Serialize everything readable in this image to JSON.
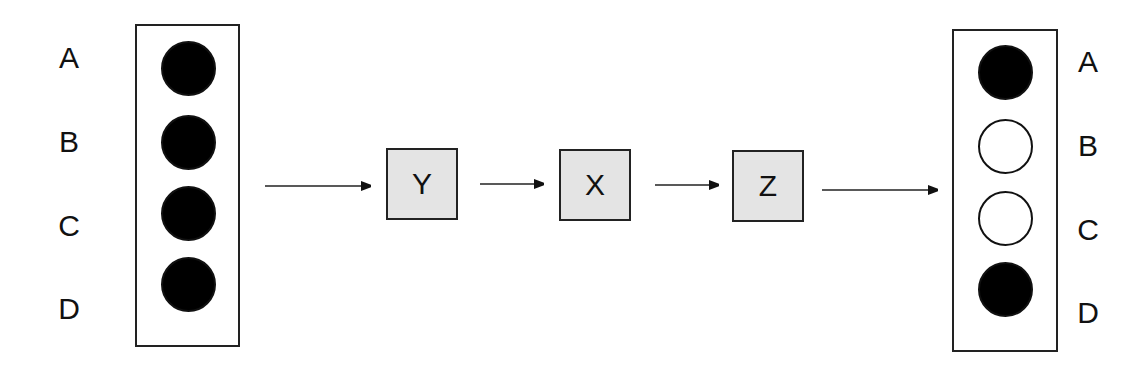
{
  "input_panel": {
    "labels": [
      "A",
      "B",
      "C",
      "D"
    ],
    "states": [
      "filled",
      "filled",
      "filled",
      "filled"
    ]
  },
  "pipeline": {
    "nodes": [
      {
        "label": "Y"
      },
      {
        "label": "X"
      },
      {
        "label": "Z"
      }
    ]
  },
  "output_panel": {
    "labels": [
      "A",
      "B",
      "C",
      "D"
    ],
    "states": [
      "filled",
      "empty",
      "empty",
      "filled"
    ]
  },
  "colors": {
    "node_fill": "#e4e4e4",
    "stroke": "#222222",
    "filled_dot": "#000000"
  }
}
